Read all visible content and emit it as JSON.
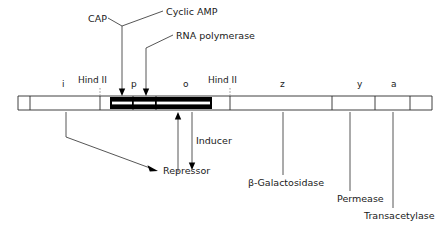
{
  "diagram": {
    "colors": {
      "line": "#2b2b2b",
      "bar_fill": "#000000",
      "dashed": "#8a8a8a",
      "text": "#1a1a1a"
    },
    "top_labels": [
      {
        "id": "cap",
        "text": "CAP",
        "x": 88,
        "y": 14
      },
      {
        "id": "cyclic-amp",
        "text": "Cyclic AMP",
        "x": 166,
        "y": 14
      },
      {
        "id": "rna-polymerase",
        "text": "RNA polymerase",
        "x": 176,
        "y": 38
      }
    ],
    "restriction_sites": [
      {
        "id": "hind-ii-left",
        "text": "Hind II",
        "x": 78,
        "y": 80
      },
      {
        "id": "hind-ii-right",
        "text": "Hind II",
        "x": 215,
        "y": 80
      }
    ],
    "gene_labels": [
      {
        "id": "gene-i",
        "text": "i",
        "x": 62,
        "y": 80
      },
      {
        "id": "gene-p",
        "text": "p",
        "x": 131,
        "y": 80
      },
      {
        "id": "gene-o",
        "text": "o",
        "x": 183,
        "y": 80
      },
      {
        "id": "gene-z",
        "text": "z",
        "x": 280,
        "y": 80
      },
      {
        "id": "gene-y",
        "text": "y",
        "x": 357,
        "y": 80
      },
      {
        "id": "gene-a",
        "text": "a",
        "x": 391,
        "y": 80
      }
    ],
    "bottom_labels": [
      {
        "id": "inducer",
        "text": "Inducer",
        "x": 196,
        "y": 136
      },
      {
        "id": "repressor",
        "text": "Repressor",
        "x": 163,
        "y": 168
      },
      {
        "id": "beta-galactosidase",
        "text": "β-Galactosidase",
        "x": 248,
        "y": 182
      },
      {
        "id": "permease",
        "text": "Permease",
        "x": 337,
        "y": 198
      },
      {
        "id": "transacetylase",
        "text": "Transacetylase",
        "x": 364,
        "y": 215
      }
    ],
    "bar": {
      "y_top": 96,
      "y_bottom": 110,
      "x_start": 18,
      "x_end": 432,
      "operon_x_start": 110,
      "operon_x_end": 212
    },
    "ticks": [
      18,
      30,
      100,
      133,
      156,
      212,
      230,
      332,
      375,
      410,
      432
    ]
  }
}
